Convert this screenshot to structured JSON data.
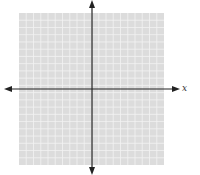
{
  "diagram": {
    "type": "coordinate-plane",
    "x_axis_label": "x",
    "grid": {
      "left": 19,
      "top": 13,
      "right": 164,
      "bottom": 165,
      "cols": 20,
      "rows": 21,
      "background": "#dcdcdc",
      "line_color": "#f2f2f2"
    },
    "origin": {
      "x": 92,
      "y": 89
    },
    "axis_color": "#222222"
  }
}
